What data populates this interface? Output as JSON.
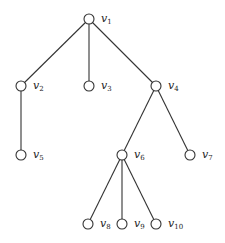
{
  "diagram": {
    "type": "tree",
    "root": "v1",
    "nodes": [
      {
        "id": "v1",
        "base": "v",
        "sub": "1",
        "x": 89,
        "y": 19
      },
      {
        "id": "v2",
        "base": "v",
        "sub": "2",
        "x": 21,
        "y": 86
      },
      {
        "id": "v3",
        "base": "v",
        "sub": "3",
        "x": 89,
        "y": 86
      },
      {
        "id": "v4",
        "base": "v",
        "sub": "4",
        "x": 156,
        "y": 86
      },
      {
        "id": "v5",
        "base": "v",
        "sub": "5",
        "x": 21,
        "y": 155
      },
      {
        "id": "v6",
        "base": "v",
        "sub": "6",
        "x": 122,
        "y": 155
      },
      {
        "id": "v7",
        "base": "v",
        "sub": "7",
        "x": 190,
        "y": 155
      },
      {
        "id": "v8",
        "base": "v",
        "sub": "8",
        "x": 88,
        "y": 224
      },
      {
        "id": "v9",
        "base": "v",
        "sub": "9",
        "x": 122,
        "y": 224
      },
      {
        "id": "v10",
        "base": "v",
        "sub": "10",
        "x": 156,
        "y": 224
      }
    ],
    "edges": [
      [
        "v1",
        "v2"
      ],
      [
        "v1",
        "v3"
      ],
      [
        "v1",
        "v4"
      ],
      [
        "v2",
        "v5"
      ],
      [
        "v4",
        "v6"
      ],
      [
        "v4",
        "v7"
      ],
      [
        "v6",
        "v8"
      ],
      [
        "v6",
        "v9"
      ],
      [
        "v6",
        "v10"
      ]
    ],
    "node_radius": 5,
    "colors": {
      "stroke": "#333333",
      "fill": "#ffffff",
      "background": "#ffffff"
    }
  }
}
